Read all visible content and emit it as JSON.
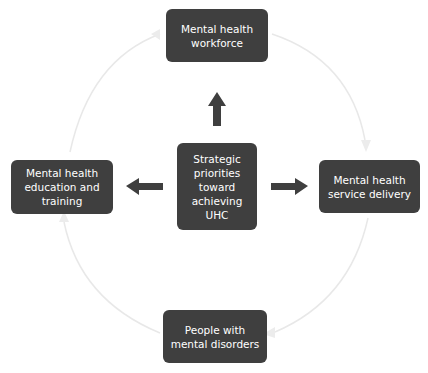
{
  "diagram": {
    "type": "cycle-with-hub",
    "hub": {
      "label": "Strategic priorities toward achieving UHC"
    },
    "nodes": [
      {
        "id": "top",
        "label": "Mental health workforce"
      },
      {
        "id": "right",
        "label": "Mental health service delivery"
      },
      {
        "id": "bottom",
        "label": "People with mental disorders"
      },
      {
        "id": "left",
        "label": "Mental health education and training"
      }
    ],
    "hub_arrows": [
      "top",
      "left",
      "right"
    ],
    "cycle_direction": "clockwise",
    "colors": {
      "box": "#3f3f3f",
      "box_text": "#ffffff",
      "arrow": "#3f3f3f",
      "cycle_arc": "#e6e6e6"
    }
  }
}
